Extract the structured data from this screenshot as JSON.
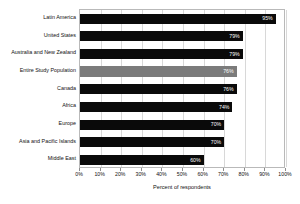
{
  "chart_data": {
    "type": "bar",
    "orientation": "horizontal",
    "title": "",
    "xlabel": "Percent of respondents",
    "ylabel": "",
    "xlim": [
      0,
      100
    ],
    "grid": true,
    "legend": "none",
    "categories": [
      "Latin America",
      "United States",
      "Australia and New Zealand",
      "Entire Study Population",
      "Canada",
      "Africa",
      "Europe",
      "Asia and Pacific Islands",
      "Middle East"
    ],
    "values": [
      95,
      79,
      79,
      76,
      76,
      74,
      70,
      70,
      60
    ],
    "value_labels": [
      "95%",
      "79%",
      "79%",
      "76%",
      "76%",
      "74%",
      "70%",
      "70%",
      "60%"
    ],
    "highlighted_category": "Entire Study Population",
    "tick_labels": [
      "0%",
      "10%",
      "20%",
      "30%",
      "40%",
      "50%",
      "60%",
      "70%",
      "80%",
      "90%",
      "100%"
    ],
    "tick_values": [
      0,
      10,
      20,
      30,
      40,
      50,
      60,
      70,
      80,
      90,
      100
    ],
    "colors": {
      "bar": "#0a0a0a",
      "bar_highlight": "#7b7b7b",
      "value_text": "#ffffff",
      "grid": "#d8d8d8",
      "axis": "#b9b9b9",
      "background": "#ffffff",
      "text": "#111111"
    }
  }
}
